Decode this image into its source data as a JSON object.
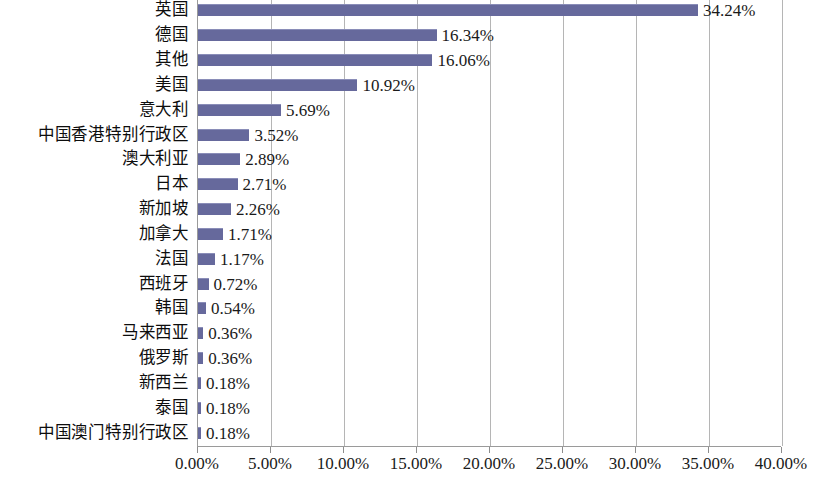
{
  "chart_data": {
    "type": "bar",
    "orientation": "horizontal",
    "title": "",
    "subtitle": "",
    "xlabel": "",
    "ylabel": "",
    "xlim": [
      0,
      40
    ],
    "xtick_labels": [
      "0.00%",
      "5.00%",
      "10.00%",
      "15.00%",
      "20.00%",
      "25.00%",
      "30.00%",
      "35.00%",
      "40.00%"
    ],
    "xticks": [
      0,
      5,
      10,
      15,
      20,
      25,
      30,
      35,
      40
    ],
    "grid": true,
    "legend": false,
    "value_suffix": "%",
    "categories": [
      "英国",
      "德国",
      "其他",
      "美国",
      "意大利",
      "中国香港特别行政区",
      "澳大利亚",
      "日本",
      "新加坡",
      "加拿大",
      "法国",
      "西班牙",
      "韩国",
      "马来西亚",
      "俄罗斯",
      "新西兰",
      "泰国",
      "中国澳门特别行政区"
    ],
    "values": [
      34.24,
      16.34,
      16.06,
      10.92,
      5.69,
      3.52,
      2.89,
      2.71,
      2.26,
      1.71,
      1.17,
      0.72,
      0.54,
      0.36,
      0.36,
      0.18,
      0.18,
      0.18
    ],
    "data_labels": [
      "34.24%",
      "16.34%",
      "16.06%",
      "10.92%",
      "5.69%",
      "3.52%",
      "2.89%",
      "2.71%",
      "2.26%",
      "1.71%",
      "1.17%",
      "0.72%",
      "0.54%",
      "0.36%",
      "0.36%",
      "0.18%",
      "0.18%",
      "0.18%"
    ],
    "bar_color": "#66699c",
    "gridline_color": "#b5b5b5",
    "axis_color": "#9a9a9a",
    "background_color": "#ffffff"
  }
}
